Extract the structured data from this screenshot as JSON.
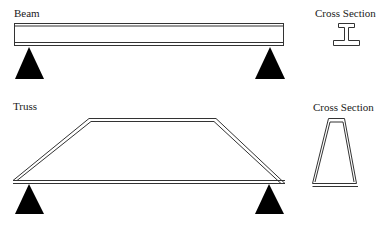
{
  "beam_section": {
    "label": "Beam",
    "cross_section_label": "Cross Section",
    "cross_section_shape": "I-beam"
  },
  "truss_section": {
    "label": "Truss",
    "cross_section_label": "Cross Section",
    "cross_section_shape": "trapezoid"
  },
  "colors": {
    "line": "#333333",
    "support": "#000000",
    "background": "#ffffff"
  }
}
